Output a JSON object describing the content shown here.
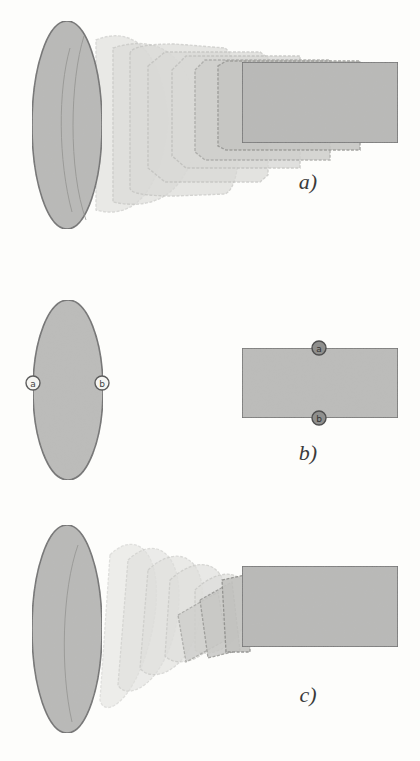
{
  "figure": {
    "panels": [
      {
        "id": "a",
        "label": "a)",
        "description": "Morph from ellipse to rectangle via straight interpolation"
      },
      {
        "id": "b",
        "label": "b)",
        "description": "Correspondence points a and b on ellipse and rectangle"
      },
      {
        "id": "c",
        "label": "c)",
        "description": "Morph from ellipse to rectangle with rotation along curved path"
      }
    ],
    "markers": {
      "ellipse": [
        "a",
        "b"
      ],
      "rectangle": [
        "a",
        "b"
      ]
    }
  },
  "colors": {
    "fill": "#b9b9b7",
    "stroke": "#6f6f6f",
    "ghost_stroke": "#c9c9c6",
    "background": "#fdfdfb"
  }
}
